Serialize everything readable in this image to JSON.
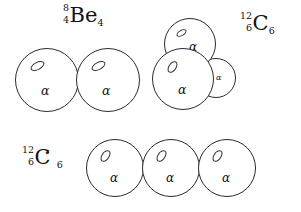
{
  "figure": {
    "background_color": "#ffffff",
    "line_color": "#2b2b2b",
    "text_color": "#111111"
  },
  "nuclides": [
    {
      "id": "be8",
      "mass_number": "8",
      "atomic_number": "4",
      "symbol": "Be",
      "post_subscript": "4",
      "excited_marker": "",
      "alpha_count": 2
    },
    {
      "id": "c12",
      "mass_number": "12",
      "atomic_number": "6",
      "symbol": "C",
      "post_subscript": "6",
      "excited_marker": "",
      "alpha_count": 3
    },
    {
      "id": "c12-excited",
      "mass_number": "12",
      "atomic_number": "6",
      "symbol": "C",
      "post_subscript": "6",
      "excited_marker": "⋆",
      "alpha_count": 3
    }
  ],
  "clusters": {
    "be8": {
      "arrangement": "linear-pair",
      "particles": [
        {
          "label": "α",
          "inner_marker": "deuteron-ellipse"
        },
        {
          "label": "α",
          "inner_marker": "deuteron-ellipse"
        }
      ]
    },
    "c12": {
      "arrangement": "triangular-compact",
      "particles": [
        {
          "label": "α",
          "inner_marker": "deuteron-ellipse"
        },
        {
          "label": "α",
          "inner_marker": "deuteron-ellipse"
        },
        {
          "label": "α",
          "inner_marker": "none"
        }
      ]
    },
    "c12_excited": {
      "arrangement": "linear-chain",
      "particles": [
        {
          "label": "α",
          "inner_marker": "deuteron-ellipse"
        },
        {
          "label": "α",
          "inner_marker": "deuteron-ellipse"
        },
        {
          "label": "α",
          "inner_marker": "deuteron-ellipse"
        }
      ]
    }
  }
}
